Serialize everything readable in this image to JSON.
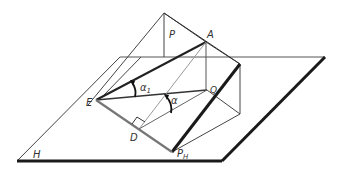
{
  "colors": {
    "line": "#2b2b2b",
    "thin": "#444444",
    "light": "#8c8c8c",
    "label": "#333333",
    "background": "#ffffff"
  },
  "labels": {
    "P": "P",
    "A": "A",
    "Q": "Q",
    "E": "E",
    "D": "D",
    "H": "H",
    "PH": "P",
    "PH_sub": "H",
    "alpha1": "α",
    "alpha1_sub": "1",
    "alpha": "α"
  },
  "points": {
    "apex": [
      164,
      13
    ],
    "A": [
      206,
      42
    ],
    "ridge_top": [
      240,
      64
    ],
    "ridge_bottom": [
      240,
      114
    ],
    "Q": [
      207,
      90
    ],
    "E": [
      96,
      100
    ],
    "D": [
      139,
      129
    ],
    "PH": [
      172,
      152
    ],
    "H_top_left": [
      120,
      57
    ],
    "H_top_right": [
      325,
      57
    ],
    "H_bottom_right": [
      222,
      161
    ],
    "H_bottom_left": [
      17,
      161
    ]
  }
}
